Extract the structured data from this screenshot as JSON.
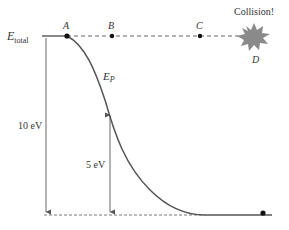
{
  "diagram": {
    "energy_label_main": "E",
    "energy_label_sub": "total",
    "curve_label_main": "E",
    "curve_label_sub": "P",
    "points": [
      {
        "id": "A",
        "label": "A"
      },
      {
        "id": "B",
        "label": "B"
      },
      {
        "id": "C",
        "label": "C"
      },
      {
        "id": "D",
        "label": "D"
      }
    ],
    "collision_label": "Collision!",
    "arrow_total_label": "10 eV",
    "arrow_partial_label": "5 eV",
    "colors": {
      "line": "#555555",
      "dot": "#111111",
      "collision": "#8a8a8a",
      "text": "#333333"
    }
  }
}
